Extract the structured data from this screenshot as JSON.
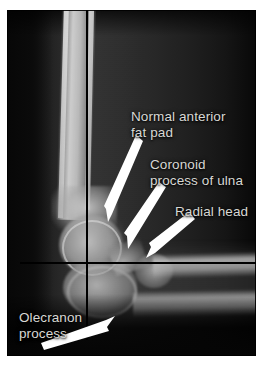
{
  "figure": {
    "kind": "annotated-radiograph",
    "view": "lateral elbow radiograph",
    "plate_background_color": "#050505",
    "page_background_color": "#ffffff",
    "label_text_color": "#d8d8d4",
    "arrow_color": "#ffffff",
    "reference_line_color": "#000000"
  },
  "annotations": [
    {
      "id": "normal-anterior-fat-pad",
      "text": "Normal anterior\nfat pad",
      "label_x": 124,
      "label_y": 99,
      "arrow_from_x": 133,
      "arrow_from_y": 134,
      "arrow_to_x": 104,
      "arrow_to_y": 212
    },
    {
      "id": "coronoid-process-of-ulna",
      "text": "Coronoid\nprocess of ulna",
      "label_x": 143,
      "label_y": 147,
      "arrow_from_x": 157,
      "arrow_from_y": 182,
      "arrow_to_x": 126,
      "arrow_to_y": 247
    },
    {
      "id": "radial-head",
      "text": "Radial head",
      "label_x": 168,
      "label_y": 194,
      "arrow_from_x": 186,
      "arrow_from_y": 215,
      "arrow_to_x": 146,
      "arrow_to_y": 256
    },
    {
      "id": "olecranon-process",
      "text": "Olecranon\nprocess",
      "label_x": 12,
      "label_y": 300,
      "arrow_from_x": 43,
      "arrow_from_y": 348,
      "arrow_to_x": 110,
      "arrow_to_y": 325
    }
  ],
  "reference_lines": [
    {
      "id": "horizontal-reference-line",
      "orientation": "horizontal",
      "y": 262
    },
    {
      "id": "vertical-reference-line",
      "orientation": "vertical",
      "x": 86
    }
  ],
  "anatomy": [
    {
      "id": "humerus",
      "label": "humerus"
    },
    {
      "id": "distal-humerus-condyle",
      "label": "distal humeral condyle"
    },
    {
      "id": "olecranon-process-bone",
      "label": "olecranon process"
    },
    {
      "id": "coronoid-process-bone",
      "label": "coronoid process of ulna"
    },
    {
      "id": "radial-head-bone",
      "label": "radial head"
    },
    {
      "id": "radius",
      "label": "radius"
    },
    {
      "id": "ulna",
      "label": "ulna"
    }
  ]
}
